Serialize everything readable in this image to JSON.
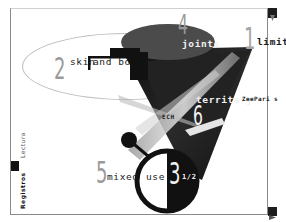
{
  "window": {
    "frame_color": "#8a8a8a",
    "accent_dark": "#1a1a1a",
    "ellipse_fill": "#4a4a4a",
    "number_color": "#9a9a9a"
  },
  "nav_items": [
    {
      "number": "1",
      "label": "limits"
    },
    {
      "number": "2",
      "label": "skin and bones"
    },
    {
      "number": "3",
      "fraction": "1/2",
      "label": "use"
    },
    {
      "number": "4",
      "label": "joints"
    },
    {
      "number": "5",
      "label": "mixed"
    },
    {
      "number": "6",
      "label": "territory"
    }
  ],
  "labels": {
    "skin_text": "skin",
    "and_text": "and bo",
    "tech_text": "ECH",
    "brand": "ZeePari s"
  },
  "sidebar": {
    "tabs": [
      {
        "label": "Lectura",
        "active": false
      },
      {
        "label": "Registros",
        "active": true
      }
    ]
  },
  "controls": {
    "top_right_icon": "dropdown-arrow-icon",
    "bottom_right_icon": "next-arrow-icon"
  }
}
